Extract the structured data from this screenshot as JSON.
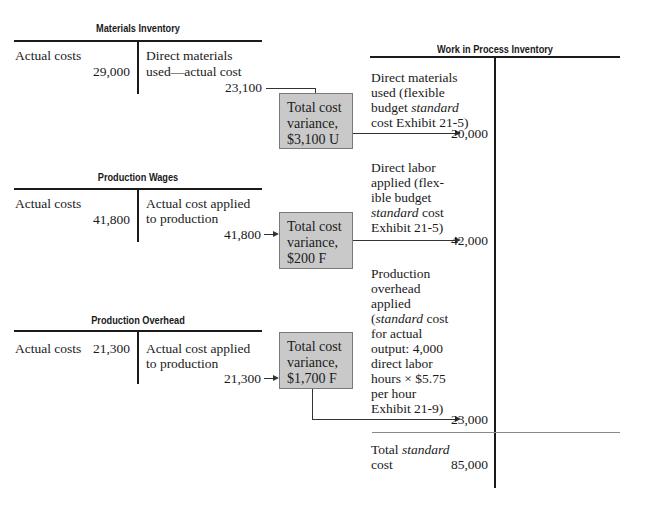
{
  "materials_inventory": {
    "title": "Materials Inventory",
    "debit_label": "Actual costs",
    "debit_amount": "29,000",
    "credit_label_line1": "Direct materials",
    "credit_label_line2": "used—actual cost",
    "credit_amount": "23,100"
  },
  "production_wages": {
    "title": "Production Wages",
    "debit_label": "Actual costs",
    "debit_amount": "41,800",
    "credit_label_line1": "Actual cost applied",
    "credit_label_line2": "to production",
    "credit_amount": "41,800"
  },
  "production_overhead": {
    "title": "Production Overhead",
    "debit_label": "Actual costs",
    "debit_amount": "21,300",
    "credit_label_line1": "Actual cost applied",
    "credit_label_line2": "to production",
    "credit_amount": "21,300"
  },
  "variance_boxes": [
    {
      "line1": "Total cost",
      "line2": "variance,",
      "line3": "$3,100 U"
    },
    {
      "line1": "Total cost",
      "line2": "variance,",
      "line3": "$200 F"
    },
    {
      "line1": "Total cost",
      "line2": "variance,",
      "line3": "$1,700 F"
    }
  ],
  "work_in_process": {
    "title": "Work in Process Inventory",
    "entries": [
      {
        "lines": [
          "Direct materials",
          "used (flexible"
        ],
        "line3_pre": "budget ",
        "line3_italic": "standard",
        "line4": "cost Exhibit 21-5)",
        "amount": "20,000"
      },
      {
        "lines": [
          "Direct labor",
          "applied (flex-",
          "ible budget"
        ],
        "line4_italic": "standard",
        "line4_post": " cost",
        "line5": "Exhibit 21-5)",
        "amount": "42,000"
      },
      {
        "lines": [
          "Production",
          "overhead",
          "applied"
        ],
        "line4_pre": "(",
        "line4_italic": "standard",
        "line4_post": " cost",
        "rest": [
          "for actual",
          "output: 4,000",
          "direct labor",
          "hours × $5.75",
          "per hour",
          "Exhibit 21-9)"
        ],
        "amount": "23,000"
      }
    ],
    "total_pre": "Total ",
    "total_italic": "standard",
    "total_line2": "cost",
    "total_amount": "85,000"
  }
}
